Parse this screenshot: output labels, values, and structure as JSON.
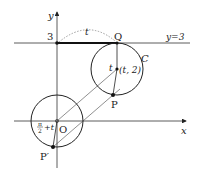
{
  "diagram": {
    "axes": {
      "x_label": "x",
      "y_label": "y",
      "origin_label": "O"
    },
    "y_tick": "3",
    "line_label": "y=3",
    "arc_label": "t",
    "circle_label": "C",
    "center_label": "(t, 2)",
    "center_angle_label": "t",
    "points": {
      "Q": "Q",
      "P": "P",
      "P_prime": "P′"
    },
    "angle_label": {
      "frac_num": "π",
      "frac_den": "2",
      "rest": "+t"
    },
    "colors": {
      "stroke": "#222222",
      "dotted": "#888888",
      "background": "#ffffff"
    }
  }
}
